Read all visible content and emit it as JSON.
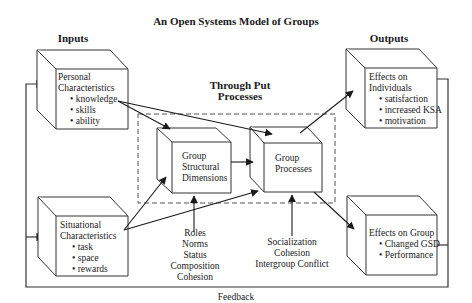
{
  "title": "An Open Systems Model of Groups",
  "sections": {
    "inputs": "Inputs",
    "throughput_line1": "Through Put",
    "throughput_line2": "Processes",
    "outputs": "Outputs",
    "feedback": "Feedback"
  },
  "boxes": {
    "personal": {
      "title_line1": "Personal",
      "title_line2": "Characteristics",
      "items": [
        "• knowledge",
        "• skills",
        "• ability"
      ]
    },
    "situational": {
      "title_line1": "Situational",
      "title_line2": "Characteristics",
      "items": [
        "• task",
        "• space",
        "• rewards"
      ]
    },
    "structural": {
      "lines": [
        "Group",
        "Structural",
        "Dimensions"
      ]
    },
    "processes": {
      "lines": [
        "Group",
        "Processes"
      ]
    },
    "individuals": {
      "title_line1": "Effects on",
      "title_line2": "Individuals",
      "items": [
        "• satisfaction",
        "• increased KSA",
        "• motivation"
      ]
    },
    "group": {
      "title_line1": "Effects on Group",
      "items": [
        "• Changed GSD",
        "• Performance"
      ]
    }
  },
  "structural_factors": [
    "Roles",
    "Norms",
    "Status",
    "Composition",
    "Cohesion"
  ],
  "process_factors": [
    "Socialization",
    "Cohesion",
    "Intergroup Conflict"
  ]
}
